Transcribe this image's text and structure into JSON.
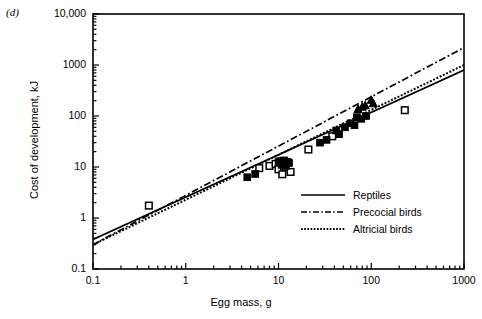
{
  "panel": {
    "label": "(d)"
  },
  "chart_data": {
    "type": "scatter",
    "title": "",
    "panel_label": "(d)",
    "xlabel": "Egg mass, g",
    "ylabel": "Cost of development, kJ",
    "xscale": "log",
    "yscale": "log",
    "xlim": [
      0.1,
      1000
    ],
    "ylim": [
      0.1,
      10000
    ],
    "xticks": [
      "0.1",
      "1",
      "10",
      "100",
      "1000"
    ],
    "xtick_values": [
      0.1,
      1,
      10,
      100,
      1000
    ],
    "yticks": [
      "0.1",
      "1",
      "10",
      "100",
      "1000",
      "10,000"
    ],
    "ytick_values": [
      0.1,
      1,
      10,
      100,
      1000,
      10000
    ],
    "grid": false,
    "legend_position": "inside-lower-right",
    "legend": [
      {
        "label": "Reptiles",
        "style": "solid"
      },
      {
        "label": "Precocial birds",
        "style": "dash-dot"
      },
      {
        "label": "Altricial birds",
        "style": "dotted"
      }
    ],
    "series": [
      {
        "name": "Reptiles",
        "type": "line",
        "style": "solid",
        "endpoints": [
          [
            0.1,
            0.38
          ],
          [
            1000,
            800
          ]
        ]
      },
      {
        "name": "Precocial birds",
        "type": "line",
        "style": "dash-dot",
        "endpoints": [
          [
            0.1,
            0.3
          ],
          [
            1000,
            2200
          ]
        ]
      },
      {
        "name": "Altricial birds",
        "type": "line",
        "style": "dotted",
        "endpoints": [
          [
            0.1,
            0.3
          ],
          [
            1000,
            1000
          ]
        ]
      },
      {
        "name": "Open squares",
        "type": "scatter",
        "marker": "open-square",
        "points": [
          [
            0.4,
            1.75
          ],
          [
            6.2,
            9.5
          ],
          [
            8.0,
            10.5
          ],
          [
            9.3,
            11.5
          ],
          [
            10.0,
            9.0
          ],
          [
            10.5,
            13.0
          ],
          [
            11.0,
            7.2
          ],
          [
            11.5,
            10.0
          ],
          [
            12.5,
            12.5
          ],
          [
            13.5,
            8.0
          ],
          [
            21.0,
            22.0
          ],
          [
            38.0,
            40.0
          ],
          [
            230.0,
            130.0
          ]
        ]
      },
      {
        "name": "Filled squares",
        "type": "scatter",
        "marker": "filled-square",
        "points": [
          [
            4.6,
            6.3
          ],
          [
            5.6,
            7.3
          ],
          [
            10.0,
            12.5
          ],
          [
            10.8,
            11.0
          ],
          [
            11.5,
            13.5
          ],
          [
            12.0,
            10.5
          ],
          [
            13.0,
            12.0
          ],
          [
            28.0,
            30.0
          ],
          [
            33.0,
            34.0
          ],
          [
            42.0,
            52.0
          ],
          [
            45.0,
            44.0
          ],
          [
            52.0,
            60.0
          ],
          [
            60.0,
            72.0
          ],
          [
            66.0,
            66.0
          ],
          [
            70.0,
            95.0
          ],
          [
            78.0,
            88.0
          ],
          [
            88.0,
            100.0
          ]
        ]
      },
      {
        "name": "Filled triangles",
        "type": "scatter",
        "marker": "filled-triangle",
        "points": [
          [
            72.0,
            135.0
          ],
          [
            80.0,
            150.0
          ],
          [
            86.0,
            160.0
          ],
          [
            100.0,
            205.0
          ],
          [
            105.0,
            175.0
          ]
        ]
      }
    ]
  }
}
